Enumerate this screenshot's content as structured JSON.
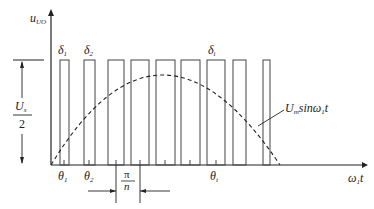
{
  "diagram": {
    "y_axis_label": "u",
    "y_axis_sub": "UO",
    "x_axis_label": "ω",
    "x_axis_sub": "1",
    "x_axis_suffix": "t",
    "amplitude_label_num": "U",
    "amplitude_label_num_sub": "s",
    "amplitude_label_den": "2",
    "curve_label_main": "U",
    "curve_label_sub": "m",
    "curve_label_fn": "sinω",
    "curve_label_fn_sub": "1",
    "curve_label_t": "t",
    "pulse_width_labels": [
      {
        "text": "δ",
        "sub": "1"
      },
      {
        "text": "δ",
        "sub": "2"
      },
      {
        "text": "δ",
        "sub": "i"
      }
    ],
    "angle_labels": [
      {
        "text": "θ",
        "sub": "1"
      },
      {
        "text": "θ",
        "sub": "2"
      },
      {
        "text": "θ",
        "sub": "i"
      }
    ],
    "period_label_num": "π",
    "period_label_den": "n",
    "pulses": [
      {
        "x1": 60,
        "x2": 69
      },
      {
        "x1": 84,
        "x2": 95
      },
      {
        "x1": 108,
        "x2": 124
      },
      {
        "x1": 131,
        "x2": 149
      },
      {
        "x1": 156,
        "x2": 175
      },
      {
        "x1": 181,
        "x2": 200
      },
      {
        "x1": 207,
        "x2": 225
      },
      {
        "x1": 233,
        "x2": 246
      },
      {
        "x1": 263,
        "x2": 270
      }
    ]
  }
}
